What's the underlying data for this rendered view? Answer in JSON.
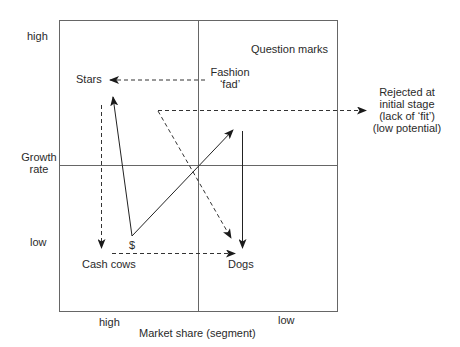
{
  "diagram": {
    "type": "BCG growth-share matrix with product trajectories",
    "y_axis": {
      "title_line1": "Growth",
      "title_line2": "rate",
      "high": "high",
      "low": "low"
    },
    "x_axis": {
      "title": "Market share (segment)",
      "high": "high",
      "low": "low"
    },
    "quadrants": {
      "top_left": "Stars",
      "top_right": "Question marks",
      "bottom_left": "Cash cows",
      "bottom_right": "Dogs"
    },
    "annotations": {
      "fashion_line1": "Fashion",
      "fashion_line2": "‘fad’",
      "cash_symbol": "$",
      "rejected_line1": "Rejected at",
      "rejected_line2": "initial stage",
      "rejected_line3": "(lack of ‘fit’)",
      "rejected_line4": "(low potential)"
    },
    "arrows": [
      {
        "from": "Fashion fad",
        "to": "Stars",
        "style": "dashed"
      },
      {
        "from": "Question marks entry",
        "to": "Rejected at initial stage",
        "style": "dashed"
      },
      {
        "from": "Question marks entry",
        "to": "Dogs",
        "style": "dashed"
      },
      {
        "from": "Stars",
        "to": "Cash cows",
        "style": "dashed"
      },
      {
        "from": "Cash cows",
        "to": "Dogs",
        "style": "dashed"
      },
      {
        "from": "$ (Cash cows)",
        "to": "Stars",
        "style": "solid"
      },
      {
        "from": "$ (Cash cows)",
        "to": "Question marks",
        "style": "solid"
      },
      {
        "from": "Question marks",
        "to": "Dogs",
        "style": "solid"
      }
    ],
    "colors": {
      "line": "#555555",
      "arrow": "#1a1a1a",
      "text": "#2a2a2a",
      "background": "#ffffff"
    }
  }
}
